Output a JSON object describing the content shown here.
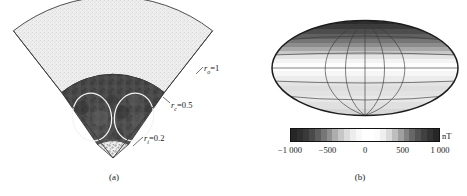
{
  "figure": {
    "panels": [
      {
        "id": "a",
        "label": "(a)",
        "type": "wedge-cross-section",
        "radial_labels": [
          {
            "name": "r_o",
            "symbol": "r",
            "subscript": "o",
            "eq": "=",
            "value": "1",
            "text": "rₒ=1"
          },
          {
            "name": "r_c",
            "symbol": "r",
            "subscript": "c",
            "eq": "=",
            "value": "0.5",
            "text": "rᶜ=0.5"
          },
          {
            "name": "r_i",
            "symbol": "r",
            "subscript": "i",
            "eq": "=",
            "value": "0.2",
            "text": "rᵢ=0.2"
          }
        ],
        "zones": [
          {
            "name": "outer-shell",
            "inner_radius": 0.5,
            "outer_radius": 1.0,
            "fill": "#ececec"
          },
          {
            "name": "convective-shell",
            "inner_radius": 0.2,
            "outer_radius": 0.5,
            "fill": "#4a4a4a"
          },
          {
            "name": "inner-core",
            "inner_radius": 0.0,
            "outer_radius": 0.2,
            "fill": "#e8e8e8"
          }
        ],
        "convection_cells": 2,
        "cell_outline_color": "#f2f2f2"
      },
      {
        "id": "b",
        "label": "(b)",
        "type": "hammer-projection-map",
        "graticule": {
          "meridians": 5,
          "parallels": 5
        },
        "colorbar": {
          "unit": "nT",
          "ticks": [
            "−1 000",
            "−500",
            "0",
            "500",
            "1 000"
          ],
          "tick_values": [
            -1000,
            -500,
            0,
            500,
            1000
          ],
          "vmin": -1000,
          "vmax": 1000,
          "segments": [
            "#262626",
            "#2f2f2f",
            "#3a3a3a",
            "#4a4a4a",
            "#5e5e5e",
            "#767676",
            "#8f8f8f",
            "#adadad",
            "#c6c6c6",
            "#dcdcdc",
            "#ededed",
            "#f8f8f8",
            "#ffffff",
            "#ffffff",
            "#fbfbfb",
            "#efefef",
            "#dadada",
            "#bebebe",
            "#a0a0a0",
            "#828282",
            "#676767",
            "#525252",
            "#414141",
            "#333333",
            "#272727"
          ]
        }
      }
    ]
  },
  "chart_data": {
    "type": "heatmap",
    "title": "",
    "panels": [
      {
        "id": "a",
        "caption": "(a)",
        "description": "Meridional wedge cross-section of a rotating spherical shell dynamo model",
        "radii": {
          "r_i": 0.2,
          "r_c": 0.5,
          "r_o": 1.0
        },
        "angular_extent_deg": 100,
        "convection_cell_count": 2
      },
      {
        "id": "b",
        "caption": "(b)",
        "description": "Radial magnetic field at the outer surface, Hammer equal-area projection",
        "colorbar_label": "nT",
        "colorbar_ticks": [
          -1000,
          -500,
          0,
          500,
          1000
        ],
        "zlim": [
          -1000,
          1000
        ],
        "latitude_bands_nT": [
          {
            "lat_range": [
              90,
              70
            ],
            "value": -950
          },
          {
            "lat_range": [
              70,
              55
            ],
            "value": -700
          },
          {
            "lat_range": [
              55,
              40
            ],
            "value": -420
          },
          {
            "lat_range": [
              40,
              25
            ],
            "value": -150
          },
          {
            "lat_range": [
              25,
              10
            ],
            "value": 60
          },
          {
            "lat_range": [
              10,
              -5
            ],
            "value": 180
          },
          {
            "lat_range": [
              -5,
              -20
            ],
            "value": 90
          },
          {
            "lat_range": [
              -20,
              -40
            ],
            "value": 40
          },
          {
            "lat_range": [
              -40,
              -60
            ],
            "value": 120
          },
          {
            "lat_range": [
              -60,
              -90
            ],
            "value": 200
          }
        ],
        "grid": true,
        "legend": "colorbar-below"
      }
    ]
  }
}
